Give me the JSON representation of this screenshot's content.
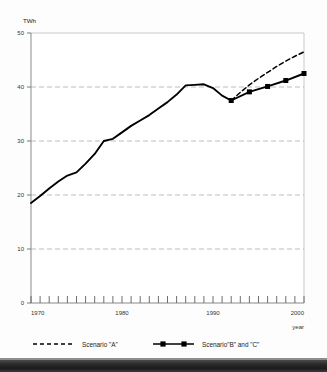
{
  "figure": {
    "unit_label": "TWh",
    "x_axis_name": "year"
  },
  "legend": {
    "items": [
      {
        "id": "scenario-a",
        "label": "Scenario \"A\"",
        "style": "dashed",
        "marker": "none",
        "color": "#000000"
      },
      {
        "id": "scenario-bc",
        "label": "Scenario\"B\" and \"C\"",
        "style": "solid",
        "marker": "square",
        "color": "#000000"
      }
    ]
  },
  "axes": {
    "y_ticks": [
      "50",
      "40",
      "30",
      "20",
      "10",
      "0"
    ],
    "x_ticks": [
      "1970",
      "1980",
      "1990",
      "2000"
    ]
  },
  "chart_data": {
    "type": "line",
    "title": "",
    "subtitle": "",
    "xlabel": "year",
    "ylabel": "TWh",
    "xlim": [
      1970,
      2000
    ],
    "ylim": [
      0,
      50
    ],
    "y_tick_values": [
      0,
      10,
      20,
      30,
      40,
      50
    ],
    "y_gridlines": [
      10,
      20,
      30,
      40
    ],
    "x_tick_values": [
      1970,
      1971,
      1972,
      1973,
      1974,
      1975,
      1976,
      1977,
      1978,
      1979,
      1980,
      1981,
      1982,
      1983,
      1984,
      1985,
      1986,
      1987,
      1988,
      1989,
      1990,
      1991,
      1992,
      1993,
      1994,
      1995,
      1996,
      1997,
      1998,
      1999,
      2000
    ],
    "x_labeled_ticks": [
      1970,
      1980,
      1990,
      2000
    ],
    "grid": "horizontal-dashed",
    "legend_position": "bottom",
    "series": [
      {
        "name": "Historical",
        "style": "solid",
        "marker": "none",
        "color": "#000000",
        "x": [
          1970,
          1971,
          1972,
          1973,
          1974,
          1975,
          1976,
          1977,
          1978,
          1979,
          1980,
          1981,
          1982,
          1983,
          1984,
          1985,
          1986,
          1987,
          1988,
          1989,
          1990,
          1991,
          1992
        ],
        "values": [
          18.5,
          19.8,
          21.2,
          22.5,
          23.6,
          24.2,
          25.8,
          27.6,
          30.0,
          30.4,
          31.6,
          32.8,
          33.8,
          34.8,
          36.0,
          37.2,
          38.6,
          40.3,
          40.4,
          40.5,
          39.8,
          38.4,
          37.5
        ]
      },
      {
        "name": "Scenario \"A\"",
        "style": "dashed",
        "marker": "none",
        "color": "#000000",
        "x": [
          1992,
          1993,
          1994,
          1995,
          1996,
          1997,
          1998,
          1999,
          2000
        ],
        "values": [
          37.5,
          39.0,
          40.4,
          41.6,
          42.7,
          43.8,
          44.8,
          45.7,
          46.5
        ]
      },
      {
        "name": "Scenario\"B\" and \"C\"",
        "style": "solid",
        "marker": "square",
        "color": "#000000",
        "x": [
          1992,
          1994,
          1996,
          1998,
          2000
        ],
        "values": [
          37.5,
          39.1,
          40.1,
          41.2,
          42.5
        ]
      }
    ]
  }
}
